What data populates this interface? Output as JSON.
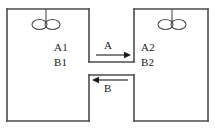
{
  "figure": {
    "type": "two-vessel-flow-diagram",
    "line_color": "#4d4d4d",
    "text_color": "#1a1a1a",
    "background_color": "#ffffff"
  },
  "vessels": {
    "left": {
      "name": "left-vessel",
      "impeller": "double-ellipse-impeller",
      "labels": [
        {
          "id": "a1",
          "text": "A1"
        },
        {
          "id": "b1",
          "text": "B1"
        }
      ]
    },
    "right": {
      "name": "right-vessel",
      "impeller": "double-ellipse-impeller",
      "labels": [
        {
          "id": "a2",
          "text": "A2"
        },
        {
          "id": "b2",
          "text": "B2"
        }
      ]
    }
  },
  "streams": [
    {
      "id": "stream-a",
      "label": "A",
      "direction": "right",
      "position": "upper-channel"
    },
    {
      "id": "stream-b",
      "label": "B",
      "direction": "left",
      "position": "lower-channel"
    }
  ]
}
